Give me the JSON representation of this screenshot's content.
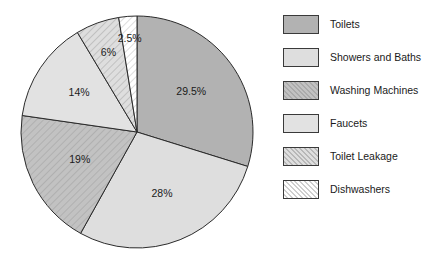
{
  "chart_data": {
    "type": "pie",
    "title": "",
    "subtitle": "",
    "xlabel": "",
    "ylabel": "",
    "grid": false,
    "legend_position": "right",
    "start_angle_deg": 0,
    "direction": "clockwise",
    "units": "percent",
    "categories": [
      "Toilets",
      "Showers and Baths",
      "Washing Machines",
      "Faucets",
      "Toilet Leakage",
      "Dishwashers"
    ],
    "values": [
      29.5,
      28,
      19,
      14,
      6,
      2.5
    ],
    "data_labels": [
      "29.5%",
      "28%",
      "19%",
      "14%",
      "6%",
      "2.5%"
    ],
    "slices": [
      {
        "label": "Toilets",
        "value": 29.5,
        "data_label": "29.5%",
        "fill": "#b2b2b2",
        "pattern": "solid",
        "stroke": "#2b2b2b"
      },
      {
        "label": "Showers and Baths",
        "value": 28,
        "data_label": "28%",
        "fill": "#dedede",
        "pattern": "solid",
        "stroke": "#2b2b2b"
      },
      {
        "label": "Washing Machines",
        "value": 19,
        "data_label": "19%",
        "fill": "#c2c2c2",
        "pattern": "diagonal-hatch",
        "stroke": "#2b2b2b"
      },
      {
        "label": "Faucets",
        "value": 14,
        "data_label": "14%",
        "fill": "#e2e2e2",
        "pattern": "solid",
        "stroke": "#2b2b2b"
      },
      {
        "label": "Toilet Leakage",
        "value": 6,
        "data_label": "6%",
        "fill": "#d6d6d6",
        "pattern": "diagonal-hatch",
        "stroke": "#2b2b2b"
      },
      {
        "label": "Dishwashers",
        "value": 2.5,
        "data_label": "2.5%",
        "fill": "#fbfbfb",
        "pattern": "diagonal-hatch",
        "stroke": "#2b2b2b"
      }
    ]
  },
  "legend": {
    "items": [
      {
        "label": "Toilets",
        "swatch": "toilets-swatch"
      },
      {
        "label": "Showers and Baths",
        "swatch": "showers-and-baths-swatch"
      },
      {
        "label": "Washing Machines",
        "swatch": "washing-machines-swatch"
      },
      {
        "label": "Faucets",
        "swatch": "faucets-swatch"
      },
      {
        "label": "Toilet Leakage",
        "swatch": "toilet-leakage-swatch"
      },
      {
        "label": "Dishwashers",
        "swatch": "dishwashers-swatch"
      }
    ]
  },
  "colors": {
    "toilets": "#b2b2b2",
    "showers_and_baths": "#dedede",
    "washing_machines": "#c2c2c2",
    "faucets": "#e2e2e2",
    "toilet_leakage": "#d6d6d6",
    "dishwashers": "#fbfbfb",
    "outline": "#2b2b2b",
    "text": "#1a1a1a",
    "background": "#ffffff"
  }
}
